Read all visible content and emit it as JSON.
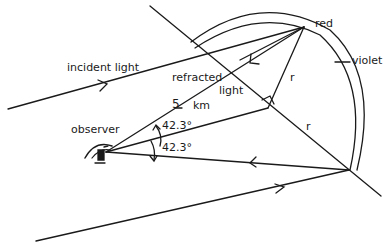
{
  "diagram": {
    "type": "rainbow-geometry",
    "labels": {
      "incident_light": "incident light",
      "refracted": "refracted",
      "light": "light",
      "distance_num": "5",
      "distance_unit": "km",
      "observer": "observer",
      "angle_upper": "42.3°",
      "angle_lower": "42.3°",
      "red": "red",
      "violet": "violet",
      "radius_upper": "r",
      "radius_lower": "r"
    },
    "colors": {
      "line": "#1a1a1a",
      "background": "#ffffff"
    }
  }
}
